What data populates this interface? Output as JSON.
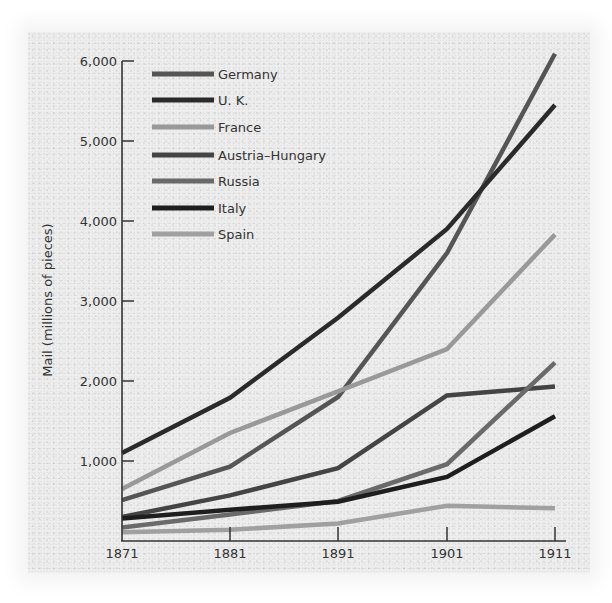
{
  "chart_data": {
    "type": "line",
    "title": "",
    "xlabel": "",
    "ylabel": "Mail (millions of pieces)",
    "x": [
      1871,
      1881,
      1891,
      1901,
      1911
    ],
    "x_tick_labels": [
      "1871",
      "1881",
      "1891",
      "1901",
      "1911"
    ],
    "y_ticks": [
      1000,
      2000,
      3000,
      4000,
      5000,
      6000
    ],
    "y_tick_labels": [
      "1,000",
      "2,000",
      "3,000",
      "4,000",
      "5,000",
      "6,000"
    ],
    "ylim": [
      0,
      6000
    ],
    "grid": false,
    "legend_position": "upper-left",
    "series": [
      {
        "name": "Germany",
        "color": "#555555",
        "values": [
          510,
          930,
          1800,
          3600,
          6090
        ]
      },
      {
        "name": "U. K.",
        "color": "#2a2a2a",
        "values": [
          1100,
          1790,
          2790,
          3900,
          5450
        ]
      },
      {
        "name": "France",
        "color": "#999999",
        "values": [
          650,
          1350,
          1870,
          2400,
          3830
        ]
      },
      {
        "name": "Austria–Hungary",
        "color": "#444444",
        "values": [
          300,
          570,
          910,
          1820,
          1930
        ]
      },
      {
        "name": "Russia",
        "color": "#6a6a6a",
        "values": [
          170,
          330,
          500,
          960,
          2230
        ]
      },
      {
        "name": "Italy",
        "color": "#1e1e1e",
        "values": [
          280,
          390,
          490,
          800,
          1560
        ]
      },
      {
        "name": "Spain",
        "color": "#a0a0a0",
        "values": [
          110,
          140,
          220,
          440,
          410
        ]
      }
    ]
  }
}
